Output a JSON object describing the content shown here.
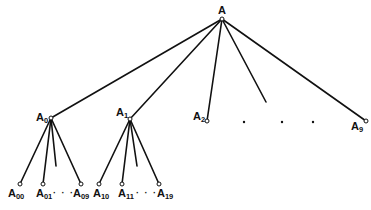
{
  "diagram": {
    "root": {
      "base": "A",
      "sub": ""
    },
    "level1": [
      {
        "base": "A",
        "sub": "0"
      },
      {
        "base": "A",
        "sub": "1"
      },
      {
        "base": "A",
        "sub": "2"
      },
      {
        "base": "A",
        "sub": "9"
      }
    ],
    "level1_ellipsis_dots": 3,
    "level2": [
      {
        "base": "A",
        "sub": "00"
      },
      {
        "base": "A",
        "sub": "01"
      },
      {
        "base": "A",
        "sub": "09"
      },
      {
        "base": "A",
        "sub": "10"
      },
      {
        "base": "A",
        "sub": "11"
      },
      {
        "base": "A",
        "sub": "19"
      }
    ],
    "level2_ellipsis": [
      "· · ·",
      "· · ·"
    ]
  }
}
